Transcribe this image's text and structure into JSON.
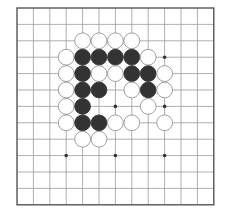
{
  "diagram": {
    "type": "go-board-section",
    "grid": {
      "columns": 13,
      "rows": 13,
      "origin_x": 17,
      "origin_y": 8,
      "spacing": 16.4
    },
    "colors": {
      "line": "#9a9a9a",
      "border": "#555555",
      "black_stone": "#333333",
      "white_stone": "#ffffff",
      "white_stroke": "#888888",
      "hoshi": "#333333"
    },
    "hoshi": [
      [
        3,
        9
      ],
      [
        6,
        9
      ],
      [
        9,
        9
      ],
      [
        9,
        3
      ],
      [
        6,
        6
      ],
      [
        9,
        6
      ]
    ],
    "stones": [
      {
        "c": "W",
        "x": 4,
        "y": 2
      },
      {
        "c": "W",
        "x": 5,
        "y": 2
      },
      {
        "c": "W",
        "x": 6,
        "y": 2
      },
      {
        "c": "W",
        "x": 7,
        "y": 2
      },
      {
        "c": "W",
        "x": 3,
        "y": 3
      },
      {
        "c": "B",
        "x": 4,
        "y": 3
      },
      {
        "c": "B",
        "x": 5,
        "y": 3
      },
      {
        "c": "B",
        "x": 6,
        "y": 3
      },
      {
        "c": "B",
        "x": 7,
        "y": 3
      },
      {
        "c": "W",
        "x": 8,
        "y": 3
      },
      {
        "c": "W",
        "x": 3,
        "y": 4
      },
      {
        "c": "B",
        "x": 4,
        "y": 4
      },
      {
        "c": "W",
        "x": 5,
        "y": 4
      },
      {
        "c": "W",
        "x": 6,
        "y": 4
      },
      {
        "c": "B",
        "x": 7,
        "y": 4
      },
      {
        "c": "B",
        "x": 8,
        "y": 4
      },
      {
        "c": "W",
        "x": 9,
        "y": 4
      },
      {
        "c": "W",
        "x": 3,
        "y": 5
      },
      {
        "c": "B",
        "x": 4,
        "y": 5
      },
      {
        "c": "B",
        "x": 5,
        "y": 5
      },
      {
        "c": "W",
        "x": 7,
        "y": 5
      },
      {
        "c": "B",
        "x": 8,
        "y": 5
      },
      {
        "c": "W",
        "x": 9,
        "y": 5
      },
      {
        "c": "W",
        "x": 3,
        "y": 6
      },
      {
        "c": "B",
        "x": 4,
        "y": 6
      },
      {
        "c": "W",
        "x": 8,
        "y": 6
      },
      {
        "c": "W",
        "x": 3,
        "y": 7
      },
      {
        "c": "B",
        "x": 4,
        "y": 7
      },
      {
        "c": "B",
        "x": 5,
        "y": 7
      },
      {
        "c": "W",
        "x": 6,
        "y": 7
      },
      {
        "c": "W",
        "x": 7,
        "y": 7
      },
      {
        "c": "W",
        "x": 9,
        "y": 7
      },
      {
        "c": "W",
        "x": 4,
        "y": 8
      },
      {
        "c": "W",
        "x": 5,
        "y": 8
      }
    ]
  }
}
